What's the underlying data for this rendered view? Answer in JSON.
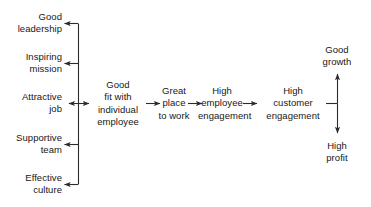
{
  "diagram": {
    "ink_color": "#171717",
    "line_color": "#2b2b2b",
    "background_color": "#ffffff",
    "drivers": {
      "group_label": "Organizational enablers",
      "items": [
        {
          "id": "good-leadership",
          "label": "Good\nleadership"
        },
        {
          "id": "inspiring-mission",
          "label": "Inspiring\nmission"
        },
        {
          "id": "attractive-job",
          "label": "Attractive\njob"
        },
        {
          "id": "supportive-team",
          "label": "Supportive\nteam"
        },
        {
          "id": "effective-culture",
          "label": "Effective\nculture"
        }
      ]
    },
    "chain": {
      "items": [
        {
          "id": "good-fit",
          "label": "Good\nfit with\nindividual\nemployee"
        },
        {
          "id": "great-place-to-work",
          "label": "Great\nplace\nto work"
        },
        {
          "id": "high-employee-engagement",
          "label": "High\nemployee\nengagement"
        },
        {
          "id": "high-customer-engagement",
          "label": "High\ncustomer\nengagement"
        }
      ]
    },
    "outcomes": {
      "items": [
        {
          "id": "good-growth",
          "label": "Good\ngrowth"
        },
        {
          "id": "high-profit",
          "label": "High\nprofit"
        }
      ]
    },
    "connectors": [
      {
        "id": "bracket-to-good-leadership",
        "type": "arrow-left"
      },
      {
        "id": "bracket-to-inspiring-mission",
        "type": "arrow-left"
      },
      {
        "id": "attractive-job-to-good-fit",
        "type": "arrow-double"
      },
      {
        "id": "bracket-to-supportive-team",
        "type": "arrow-left"
      },
      {
        "id": "bracket-to-effective-culture",
        "type": "arrow-left"
      },
      {
        "id": "good-fit-to-great-place",
        "type": "arrow-right"
      },
      {
        "id": "great-place-to-employee-engagement",
        "type": "arrow-right"
      },
      {
        "id": "employee-to-customer-engagement",
        "type": "arrow-right"
      },
      {
        "id": "customer-engagement-to-outcomes",
        "type": "tee"
      },
      {
        "id": "outcomes-to-good-growth",
        "type": "arrow-up"
      },
      {
        "id": "outcomes-to-high-profit",
        "type": "arrow-down"
      }
    ]
  }
}
